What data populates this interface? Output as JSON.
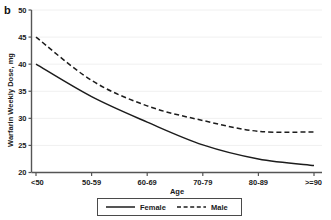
{
  "panel": {
    "label": "b"
  },
  "chart_data": {
    "type": "line",
    "title": "",
    "xlabel": "Age",
    "ylabel": "Warfarin Weekly Dose, mg",
    "categories": [
      "<50",
      "50-59",
      "60-69",
      "70-79",
      "80-89",
      ">=90"
    ],
    "series": [
      {
        "name": "Female",
        "style": "solid",
        "color": "#1c1c1c",
        "values": [
          40.0,
          34.0,
          29.3,
          25.1,
          22.5,
          21.3
        ]
      },
      {
        "name": "Male",
        "style": "dashed",
        "color": "#1c1c1c",
        "values": [
          45.0,
          37.0,
          32.3,
          29.6,
          27.6,
          27.5
        ]
      }
    ],
    "ylim": [
      20,
      50
    ],
    "yticks": [
      20,
      25,
      30,
      35,
      40,
      45,
      50
    ],
    "ytick_labels": [
      "20",
      "25",
      "30",
      "35",
      "40",
      "45",
      "50"
    ],
    "grid": true,
    "legend_position": "bottom",
    "legend_entries": [
      "Female",
      "Male"
    ]
  }
}
